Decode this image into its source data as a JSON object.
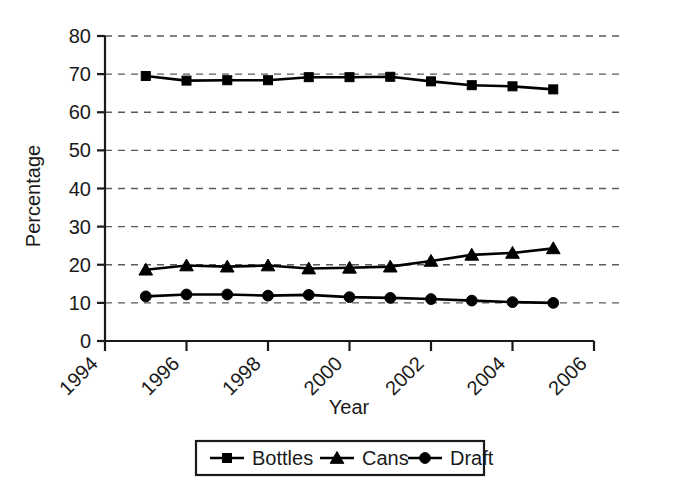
{
  "chart_data": {
    "type": "line",
    "title": "",
    "xlabel": "Year",
    "ylabel": "Percentage",
    "xlim": [
      1994,
      2006
    ],
    "ylim": [
      0,
      80
    ],
    "xticks": [
      1994,
      1996,
      1998,
      2000,
      2002,
      2004,
      2006
    ],
    "yticks": [
      0,
      10,
      20,
      30,
      40,
      50,
      60,
      70,
      80
    ],
    "xtick_labels": [
      "1994",
      "1996",
      "1998",
      "2000",
      "2002",
      "2004",
      "2006"
    ],
    "ytick_labels": [
      "0",
      "10",
      "20",
      "30",
      "40",
      "50",
      "60",
      "70",
      "80"
    ],
    "grid": "horizontal-dashed",
    "legend_position": "bottom-center",
    "x": [
      1995,
      1996,
      1997,
      1998,
      1999,
      2000,
      2001,
      2002,
      2003,
      2004,
      2005
    ],
    "series": [
      {
        "name": "Bottles",
        "marker": "square",
        "values": [
          69.5,
          68.3,
          68.4,
          68.4,
          69.2,
          69.2,
          69.3,
          68.1,
          67.1,
          66.8,
          66.0
        ]
      },
      {
        "name": "Cans",
        "marker": "triangle",
        "values": [
          18.7,
          19.8,
          19.5,
          19.8,
          19.0,
          19.2,
          19.5,
          21.0,
          22.6,
          23.1,
          24.3
        ]
      },
      {
        "name": "Draft",
        "marker": "circle",
        "values": [
          11.7,
          12.2,
          12.2,
          11.9,
          12.1,
          11.5,
          11.3,
          11.0,
          10.6,
          10.2,
          10.0
        ]
      }
    ]
  },
  "legend": {
    "items": [
      {
        "label": "Bottles",
        "marker": "square"
      },
      {
        "label": "Cans",
        "marker": "triangle"
      },
      {
        "label": "Draft",
        "marker": "circle"
      }
    ]
  },
  "colors": {
    "line": "#000000",
    "grid": "#5a5a5a",
    "axis": "#1a1a1a",
    "background": "#ffffff"
  }
}
